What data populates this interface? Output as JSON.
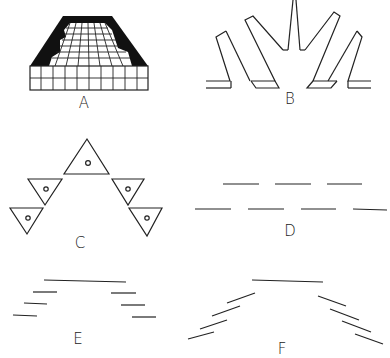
{
  "figure": {
    "panels": [
      {
        "id": "A",
        "label": "A",
        "description": "Perspective grid of rectangular seating area with dark surround"
      },
      {
        "id": "B",
        "label": "B",
        "description": "Radial fan of rectangular panels"
      },
      {
        "id": "C",
        "label": "C",
        "description": "Triangles with small circles arranged in an inverted V"
      },
      {
        "id": "D",
        "label": "D",
        "description": "Two parallel rows of short line segments"
      },
      {
        "id": "E",
        "label": "E",
        "description": "Long top segment with stepped horizontal segments on each side"
      },
      {
        "id": "F",
        "label": "F",
        "description": "Long top segment with angled segments fanning on each side"
      }
    ]
  }
}
